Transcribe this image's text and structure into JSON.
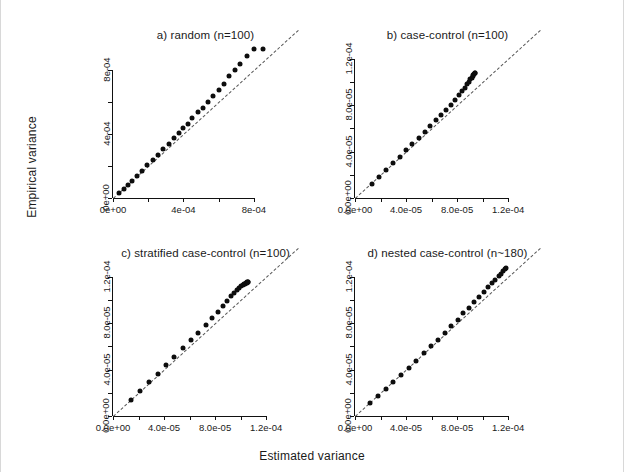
{
  "figure": {
    "xlabel": "Estimated variance",
    "ylabel": "Empirical variance",
    "point_color": "#0d0d0d",
    "refline_color": "#3a3a3a"
  },
  "chart_data": [
    {
      "type": "scatter",
      "panel": "a",
      "title": "a) random (n=100)",
      "xlabel": "Estimated variance",
      "ylabel": "Empirical variance",
      "xlim": [
        0.0,
        0.00105
      ],
      "ylim": [
        0.0,
        0.00105
      ],
      "xticks": [
        0.0,
        0.0004,
        0.0008
      ],
      "xticklabels": [
        "0e+00",
        "4e-04",
        "8e-04"
      ],
      "yticks": [
        0.0,
        0.0004,
        0.0008
      ],
      "yticklabels": [
        "0e+00",
        "4e-04",
        "8e-04"
      ],
      "grid": false,
      "legend": "none",
      "reference_line": {
        "slope": 1,
        "intercept": 0,
        "style": "dashed"
      },
      "x": [
        3.5e-05,
        6e-05,
        8.5e-05,
        0.00011,
        0.000135,
        0.000165,
        0.000195,
        0.000225,
        0.000255,
        0.000285,
        0.000315,
        0.000345,
        0.000375,
        0.0004,
        0.000425,
        0.00045,
        0.00048,
        0.00051,
        0.00054,
        0.00057,
        0.0006,
        0.00063,
        0.00066,
        0.00069,
        0.00072,
        0.00076,
        0.0008,
        0.00085
      ],
      "y": [
        3e-05,
        5.5e-05,
        8e-05,
        0.000105,
        0.000135,
        0.00017,
        0.000205,
        0.000235,
        0.00027,
        0.000305,
        0.00034,
        0.000375,
        0.000405,
        0.000435,
        0.000465,
        0.0005,
        0.000535,
        0.000565,
        0.0006,
        0.00064,
        0.000675,
        0.000715,
        0.00076,
        0.0008,
        0.00084,
        0.000885,
        0.00093,
        0.00093
      ]
    },
    {
      "type": "scatter",
      "panel": "b",
      "title": "b) case-control (n=100)",
      "xlabel": "Estimated variance",
      "ylabel": "Empirical variance",
      "xlim": [
        0.0,
        0.000145
      ],
      "ylim": [
        0.0,
        0.000145
      ],
      "xticks": [
        0.0,
        4e-05,
        8e-05,
        0.00012
      ],
      "xticklabels": [
        "0.0e+00",
        "4.0e-05",
        "8.0e-05",
        "1.2e-04"
      ],
      "yticks": [
        0.0,
        4e-05,
        8e-05,
        0.00012
      ],
      "yticklabels": [
        "0.0e+00",
        "4.0e-05",
        "8.0e-05",
        "1.2e-04"
      ],
      "grid": false,
      "legend": "none",
      "reference_line": {
        "slope": 1,
        "intercept": 0,
        "style": "dashed"
      },
      "x": [
        1.3e-05,
        1.9e-05,
        2.45e-05,
        3e-05,
        3.5e-05,
        4e-05,
        4.5e-05,
        5e-05,
        5.45e-05,
        5.9e-05,
        6.35e-05,
        6.75e-05,
        7.15e-05,
        7.5e-05,
        7.85e-05,
        8.15e-05,
        8.4e-05,
        8.62e-05,
        8.8e-05,
        8.95e-05,
        9.05e-05,
        9.15e-05,
        9.22e-05,
        9.28e-05,
        9.33e-05,
        9.37e-05,
        9.4e-05
      ],
      "y": [
        1.2e-05,
        1.8e-05,
        2.4e-05,
        3e-05,
        3.55e-05,
        4.1e-05,
        4.65e-05,
        5.2e-05,
        5.7e-05,
        6.2e-05,
        6.7e-05,
        7.15e-05,
        7.6e-05,
        8.05e-05,
        8.45e-05,
        8.85e-05,
        9.2e-05,
        9.5e-05,
        9.8e-05,
        0.0001005,
        0.0001025,
        0.000104,
        0.0001052,
        0.0001062,
        0.000107,
        0.0001076,
        0.000108
      ]
    },
    {
      "type": "scatter",
      "panel": "c",
      "title": "c) stratified case-control (n=100)",
      "xlabel": "Estimated variance",
      "ylabel": "Empirical variance",
      "xlim": [
        0.0,
        0.000145
      ],
      "ylim": [
        0.0,
        0.000145
      ],
      "xticks": [
        0.0,
        4e-05,
        8e-05,
        0.00012
      ],
      "xticklabels": [
        "0.0e+00",
        "4.0e-05",
        "8.0e-05",
        "1.2e-04"
      ],
      "yticks": [
        0.0,
        4e-05,
        8e-05,
        0.00012
      ],
      "yticklabels": [
        "0.0e+00",
        "4.0e-05",
        "8.0e-05",
        "1.2e-04"
      ],
      "grid": false,
      "legend": "none",
      "reference_line": {
        "slope": 1,
        "intercept": 0,
        "style": "dashed"
      },
      "x": [
        1.4e-05,
        2.15e-05,
        2.85e-05,
        3.5e-05,
        4.15e-05,
        4.8e-05,
        5.45e-05,
        6.1e-05,
        6.7e-05,
        7.25e-05,
        7.75e-05,
        8.2e-05,
        8.6e-05,
        8.95e-05,
        9.25e-05,
        9.5e-05,
        9.72e-05,
        9.9e-05,
        0.0001005,
        0.0001018,
        0.0001028,
        0.0001036,
        0.0001043,
        0.0001049,
        0.0001054,
        0.0001058,
        0.0001062
      ],
      "y": [
        1.35e-05,
        2.15e-05,
        2.9e-05,
        3.65e-05,
        4.4e-05,
        5.1e-05,
        5.85e-05,
        6.55e-05,
        7.2e-05,
        7.85e-05,
        8.45e-05,
        9e-05,
        9.5e-05,
        9.95e-05,
        0.0001032,
        0.0001062,
        0.0001086,
        0.0001104,
        0.0001118,
        0.0001128,
        0.0001136,
        0.0001142,
        0.0001147,
        0.0001151,
        0.0001154,
        0.0001157,
        0.0001159
      ]
    },
    {
      "type": "scatter",
      "panel": "d",
      "title": "d) nested case-control (n~180)",
      "xlabel": "Estimated variance",
      "ylabel": "Empirical variance",
      "xlim": [
        0.0,
        0.000145
      ],
      "ylim": [
        0.0,
        0.000145
      ],
      "xticks": [
        0.0,
        4e-05,
        8e-05,
        0.00012
      ],
      "xticklabels": [
        "0.0e+00",
        "4.0e-05",
        "8.0e-05",
        "1.2e-04"
      ],
      "yticks": [
        0.0,
        4e-05,
        8e-05,
        0.00012
      ],
      "yticklabels": [
        "0.0e+00",
        "4.0e-05",
        "8.0e-05",
        "1.2e-04"
      ],
      "grid": false,
      "legend": "none",
      "reference_line": {
        "slope": 1,
        "intercept": 0,
        "style": "dashed"
      },
      "x": [
        1.2e-05,
        1.8e-05,
        2.4e-05,
        3e-05,
        3.6e-05,
        4.2e-05,
        4.8e-05,
        5.4e-05,
        5.95e-05,
        6.5e-05,
        7.05e-05,
        7.55e-05,
        8.05e-05,
        8.5e-05,
        8.95e-05,
        9.35e-05,
        9.75e-05,
        0.000101,
        0.0001045,
        0.0001075,
        0.00011,
        0.0001125,
        0.0001145,
        0.0001162,
        0.0001175,
        0.0001186
      ],
      "y": [
        1.1e-05,
        1.75e-05,
        2.35e-05,
        2.95e-05,
        3.55e-05,
        4.15e-05,
        4.78e-05,
        5.4e-05,
        6e-05,
        6.6e-05,
        7.18e-05,
        7.75e-05,
        8.3e-05,
        8.85e-05,
        9.35e-05,
        9.85e-05,
        0.000103,
        0.0001072,
        0.000111,
        0.0001145,
        0.0001178,
        0.0001205,
        0.0001228,
        0.0001248,
        0.0001265,
        0.0001278
      ]
    }
  ]
}
